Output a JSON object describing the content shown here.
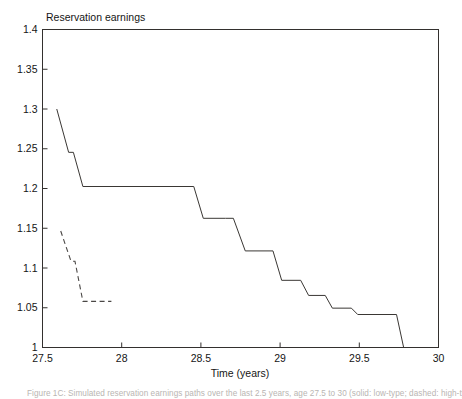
{
  "figure": {
    "plot_title": "Reservation earnings",
    "xlabel": "Time (years)",
    "caption": "Figure 1C: Simulated reservation earnings paths over the last 2.5 years, age 27.5 to 30 (solid: low-type; dashed: high-type)"
  },
  "chart_data": {
    "type": "line",
    "title": "Reservation earnings",
    "xlabel": "Time (years)",
    "ylabel": "Reservation earnings",
    "xlim": [
      27.5,
      30.0
    ],
    "ylim": [
      1.0,
      1.4
    ],
    "grid": false,
    "legend_position": "none",
    "xticks": [
      27.5,
      28,
      28.5,
      29,
      29.5,
      30
    ],
    "xtick_labels": [
      "27.5",
      "28",
      "28.5",
      "29",
      "29.5",
      "30"
    ],
    "yticks": [
      1,
      1.05,
      1.1,
      1.15,
      1.2,
      1.25,
      1.3,
      1.35,
      1.4
    ],
    "ytick_labels": [
      "1",
      "1.05",
      "1.1",
      "1.15",
      "1.2",
      "1.25",
      "1.3",
      "1.35",
      "1.4"
    ],
    "series": [
      {
        "name": "solid-path",
        "style": "solid",
        "color": "#3a3734",
        "points": [
          [
            27.59,
            1.3
          ],
          [
            27.665,
            1.2455
          ],
          [
            27.695,
            1.2455
          ],
          [
            27.755,
            1.2025
          ],
          [
            28.455,
            1.2025
          ],
          [
            28.515,
            1.1625
          ],
          [
            28.655,
            1.1625
          ],
          [
            28.705,
            1.1625
          ],
          [
            28.78,
            1.1215
          ],
          [
            28.955,
            1.1215
          ],
          [
            29.01,
            1.0845
          ],
          [
            29.13,
            1.0845
          ],
          [
            29.18,
            1.0655
          ],
          [
            29.285,
            1.0655
          ],
          [
            29.33,
            1.0495
          ],
          [
            29.45,
            1.0495
          ],
          [
            29.49,
            1.0415
          ],
          [
            29.735,
            1.0415
          ],
          [
            29.78,
            1.0
          ]
        ]
      },
      {
        "name": "dashed-path",
        "style": "dashed",
        "color": "#4a4745",
        "points": [
          [
            27.615,
            1.1465
          ],
          [
            27.68,
            1.1085
          ],
          [
            27.705,
            1.1085
          ],
          [
            27.755,
            1.058
          ],
          [
            27.935,
            1.058
          ]
        ]
      }
    ]
  }
}
